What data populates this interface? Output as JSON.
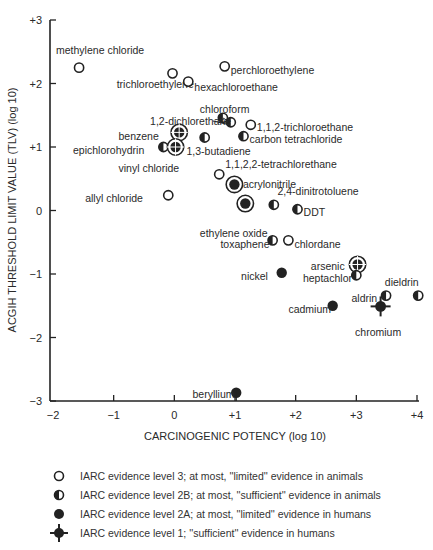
{
  "chart_data": {
    "type": "scatter",
    "title": "",
    "xlabel": "CARCINOGENIC POTENCY (log 10)",
    "ylabel": "ACGIH THRESHOLD LIMIT VALUE (TLV) (log 10)",
    "xlim": [
      -2,
      4
    ],
    "ylim": [
      -3,
      3
    ],
    "grid": false,
    "x_ticks": [
      "−2",
      "−1",
      "0",
      "+1",
      "+2",
      "+3",
      "+4"
    ],
    "x_tick_values": [
      -2,
      -1,
      0,
      1,
      2,
      3,
      4
    ],
    "y_ticks": [
      "+3",
      "+2",
      "+1",
      "0",
      "−1",
      "−2",
      "−3"
    ],
    "y_tick_values": [
      3,
      2,
      1,
      0,
      -1,
      -2,
      -3
    ],
    "legend_position": "below",
    "legend": [
      {
        "marker": "open",
        "label": "IARC evidence level 3; at most, ''limited'' evidence in animals"
      },
      {
        "marker": "half",
        "label": "IARC evidence level 2B; at most, ''sufficient'' evidence in animals"
      },
      {
        "marker": "filled",
        "label": "IARC evidence level 2A; at most, ''limited'' evidence in humans"
      },
      {
        "marker": "cross",
        "label": "IARC evidence level 1; ''sufficient'' evidence in humans"
      }
    ],
    "points": [
      {
        "name": "methylene chloride",
        "x": -1.57,
        "y": 2.25,
        "level": "3",
        "marker": "open",
        "lx": -1.95,
        "ly": 2.52,
        "anchor": "start"
      },
      {
        "name": "trichloroethylene",
        "x": -0.03,
        "y": 2.16,
        "level": "3",
        "marker": "open",
        "lx": -0.95,
        "ly": 2.0,
        "anchor": "start"
      },
      {
        "name": "hexachloroethane",
        "x": 0.23,
        "y": 2.03,
        "level": "3",
        "marker": "open",
        "lx": 0.33,
        "ly": 1.95,
        "anchor": "start"
      },
      {
        "name": "perchloroethylene",
        "x": 0.83,
        "y": 2.27,
        "level": "3",
        "marker": "open",
        "lx": 0.93,
        "ly": 2.22,
        "anchor": "start"
      },
      {
        "name": "chloroform",
        "x": 0.8,
        "y": 1.46,
        "level": "2B",
        "marker": "half",
        "lx": 0.42,
        "ly": 1.6,
        "anchor": "start"
      },
      {
        "name": "1,2-dichlorethane",
        "x": 0.93,
        "y": 1.39,
        "level": "2B",
        "marker": "half",
        "lx": -0.4,
        "ly": 1.41,
        "anchor": "start"
      },
      {
        "name": "1,1,2-trichloroethane",
        "x": 1.26,
        "y": 1.35,
        "level": "3",
        "marker": "open",
        "lx": 1.36,
        "ly": 1.32,
        "anchor": "start"
      },
      {
        "name": "carbon tetrachloride",
        "x": 1.14,
        "y": 1.17,
        "level": "2B",
        "marker": "half",
        "lx": 1.24,
        "ly": 1.12,
        "anchor": "start"
      },
      {
        "name": "benzene",
        "x": 0.08,
        "y": 1.23,
        "level": "1",
        "marker": "cross",
        "lx": -0.92,
        "ly": 1.18,
        "anchor": "start"
      },
      {
        "name": "1,3-butadiene",
        "x": 0.5,
        "y": 1.15,
        "level": "2B",
        "marker": "half",
        "lx": 0.2,
        "ly": 0.93,
        "anchor": "start"
      },
      {
        "name": "epichlorohydrin",
        "x": -0.18,
        "y": 1.0,
        "level": "2B",
        "marker": "half",
        "lx": -1.67,
        "ly": 0.96,
        "anchor": "start"
      },
      {
        "name": "vinyl chloride",
        "x": 0.02,
        "y": 1.0,
        "level": "1",
        "marker": "cross",
        "lx": -0.92,
        "ly": 0.67,
        "anchor": "start"
      },
      {
        "name": "1,1,2,2-tetrachlorethane",
        "x": 0.74,
        "y": 0.57,
        "level": "3",
        "marker": "open",
        "lx": 0.84,
        "ly": 0.74,
        "anchor": "start"
      },
      {
        "name": "acrylonitrile",
        "x": 0.99,
        "y": 0.41,
        "level": "2A",
        "marker": "filled-ring",
        "lx": 1.13,
        "ly": 0.42,
        "anchor": "start"
      },
      {
        "name": "ethylene oxide",
        "x": 1.17,
        "y": 0.11,
        "level": "2A",
        "marker": "filled-ring",
        "lx": 0.42,
        "ly": -0.35,
        "anchor": "start"
      },
      {
        "name": "allyl chloride",
        "x": -0.1,
        "y": 0.24,
        "level": "3",
        "marker": "open",
        "lx": -1.47,
        "ly": 0.2,
        "anchor": "start"
      },
      {
        "name": "2,4-dinitrotoluene",
        "x": 1.64,
        "y": 0.09,
        "level": "2B",
        "marker": "half",
        "lx": 1.7,
        "ly": 0.31,
        "anchor": "start"
      },
      {
        "name": "DDT",
        "x": 2.03,
        "y": 0.02,
        "level": "2B",
        "marker": "half",
        "lx": 2.13,
        "ly": -0.03,
        "anchor": "start"
      },
      {
        "name": "toxaphene",
        "x": 1.62,
        "y": -0.47,
        "level": "2B",
        "marker": "half",
        "lx": 0.76,
        "ly": -0.52,
        "anchor": "start"
      },
      {
        "name": "chlordane",
        "x": 1.88,
        "y": -0.47,
        "level": "3",
        "marker": "open",
        "lx": 1.98,
        "ly": -0.52,
        "anchor": "start"
      },
      {
        "name": "arsenic",
        "x": 3.02,
        "y": -0.85,
        "level": "1",
        "marker": "cross",
        "lx": 2.25,
        "ly": -0.87,
        "anchor": "start"
      },
      {
        "name": "heptachlor",
        "x": 3.0,
        "y": -1.02,
        "level": "2B",
        "marker": "half",
        "lx": 2.12,
        "ly": -1.07,
        "anchor": "start"
      },
      {
        "name": "nickel",
        "x": 1.77,
        "y": -0.98,
        "level": "2A",
        "marker": "filled",
        "lx": 1.1,
        "ly": -1.03,
        "anchor": "start"
      },
      {
        "name": "aldrin",
        "x": 3.49,
        "y": -1.34,
        "level": "2B",
        "marker": "half",
        "lx": 2.92,
        "ly": -1.38,
        "anchor": "start"
      },
      {
        "name": "dieldrin",
        "x": 4.02,
        "y": -1.34,
        "level": "2B",
        "marker": "half",
        "lx": 3.47,
        "ly": -1.13,
        "anchor": "start"
      },
      {
        "name": "cadmium",
        "x": 2.61,
        "y": -1.5,
        "level": "2A",
        "marker": "filled",
        "lx": 1.88,
        "ly": -1.55,
        "anchor": "start"
      },
      {
        "name": "chromium",
        "x": 3.4,
        "y": -1.51,
        "level": "1",
        "marker": "cross",
        "lx": 2.98,
        "ly": -1.92,
        "anchor": "start"
      },
      {
        "name": "beryllium",
        "x": 1.02,
        "y": -2.87,
        "level": "2A",
        "marker": "filled",
        "lx": 0.3,
        "ly": -2.89,
        "anchor": "start"
      }
    ]
  }
}
